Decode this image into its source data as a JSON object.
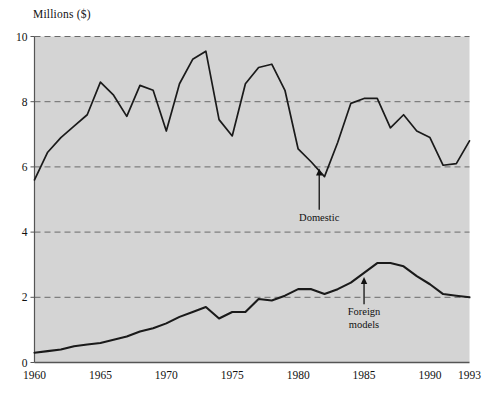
{
  "chart_data": {
    "type": "line",
    "title": "",
    "ylabel": "Millions ($)",
    "xlabel": "",
    "ylim": [
      0,
      10
    ],
    "xlim": [
      1960,
      1993
    ],
    "yticks": [
      0,
      2,
      4,
      6,
      8,
      10
    ],
    "ytick_labels": [
      "0",
      "2",
      "4",
      "6",
      "8",
      "10"
    ],
    "xticks": [
      1960,
      1965,
      1970,
      1975,
      1980,
      1985,
      1990,
      1993
    ],
    "xtick_labels": [
      "1960",
      "1965",
      "1970",
      "1975",
      "1980",
      "1985",
      "1990",
      "1993"
    ],
    "grid": "horizontal-dashed",
    "legend": "none",
    "plot_background": "#d4d4d4",
    "line_color": "#1a1a1a",
    "grid_color": "#6a6a6a",
    "x": [
      1960,
      1961,
      1962,
      1963,
      1964,
      1965,
      1966,
      1967,
      1968,
      1969,
      1970,
      1971,
      1972,
      1973,
      1974,
      1975,
      1976,
      1977,
      1978,
      1979,
      1980,
      1981,
      1982,
      1983,
      1984,
      1985,
      1986,
      1987,
      1988,
      1989,
      1990,
      1991,
      1992,
      1993
    ],
    "series": [
      {
        "name": "Domestic",
        "values": [
          5.6,
          6.45,
          6.9,
          7.25,
          7.6,
          8.6,
          8.2,
          7.55,
          8.5,
          8.35,
          7.1,
          8.55,
          9.3,
          9.55,
          7.45,
          6.95,
          8.55,
          9.05,
          9.15,
          8.35,
          6.55,
          6.15,
          5.7,
          6.75,
          7.95,
          8.1,
          8.1,
          7.2,
          7.6,
          7.1,
          6.9,
          6.05,
          6.1,
          6.8
        ]
      },
      {
        "name": "Foreign models",
        "values": [
          0.3,
          0.35,
          0.4,
          0.5,
          0.55,
          0.6,
          0.7,
          0.8,
          0.95,
          1.05,
          1.2,
          1.4,
          1.55,
          1.7,
          1.35,
          1.55,
          1.55,
          1.95,
          1.9,
          2.05,
          2.25,
          2.25,
          2.1,
          2.25,
          2.45,
          2.75,
          3.05,
          3.05,
          2.95,
          2.65,
          2.4,
          2.1,
          2.05,
          2.0
        ]
      }
    ],
    "annotations": [
      {
        "label": "Domestic",
        "lines": [
          "Domestic"
        ],
        "points_to_x": 1981.6,
        "points_to_y": 5.95,
        "label_x": 1981.6,
        "label_y": 4.35
      },
      {
        "label": "Foreign models",
        "lines": [
          "Foreign",
          "models"
        ],
        "points_to_x": 1985.0,
        "points_to_y": 2.62,
        "label_x": 1985.0,
        "label_y": 1.45
      }
    ]
  }
}
